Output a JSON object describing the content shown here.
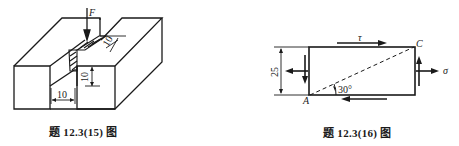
{
  "figures": [
    {
      "id": "fig-12-3-15",
      "caption": "题 12.3(15) 图",
      "description": "Block with rectangular groove; weld / shear region loaded by force F",
      "labels": {
        "force": "F",
        "groove_width": "10",
        "groove_depth": "10",
        "slant_dim": "10"
      }
    },
    {
      "id": "fig-12-3-16",
      "caption": "题 12.3(16) 图",
      "description": "Rectangular stress element with shear stress and normal stress, diagonal at 30 degrees",
      "labels": {
        "height_dim": "25",
        "shear_stress": "τ",
        "normal_stress": "σ",
        "corner_top_right": "C",
        "corner_bottom_left": "A",
        "angle": "30°"
      }
    }
  ]
}
